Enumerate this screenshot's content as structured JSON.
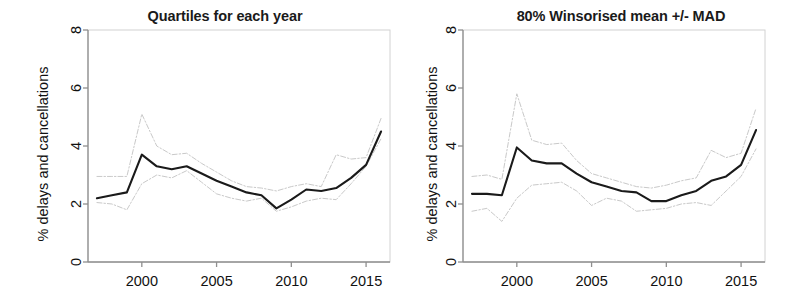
{
  "figure": {
    "width": 807,
    "height": 301,
    "background": "#ffffff"
  },
  "style": {
    "median_color": "#1a1a1a",
    "band_color": "#c9c9c9",
    "axis_color": "#9a9a9a",
    "text_color": "#111111"
  },
  "panels": [
    {
      "id": "quartiles",
      "title": "Quartiles for each year",
      "ylabel": "% delays and cancellations"
    },
    {
      "id": "winsorised",
      "title": "80% Winsorised mean +/- MAD",
      "ylabel": "% delays and cancellations"
    }
  ],
  "chart_data": [
    {
      "type": "line",
      "title": "Quartiles for each year",
      "xlabel": "",
      "ylabel": "% delays and cancellations",
      "xlim": [
        1996.4,
        2016.6
      ],
      "ylim": [
        0,
        8
      ],
      "xticks": [
        2000,
        2005,
        2010,
        2015
      ],
      "yticks": [
        0,
        2,
        4,
        6,
        8
      ],
      "grid": false,
      "legend": "none",
      "x": [
        1997,
        1998,
        1999,
        2000,
        2001,
        2002,
        2003,
        2004,
        2005,
        2006,
        2007,
        2008,
        2009,
        2010,
        2011,
        2012,
        2013,
        2014,
        2015,
        2016
      ],
      "series": [
        {
          "name": "Median",
          "style": "solid",
          "color": "#1a1a1a",
          "values": [
            2.2,
            2.3,
            2.4,
            3.7,
            3.3,
            3.2,
            3.3,
            3.05,
            2.8,
            2.6,
            2.4,
            2.3,
            1.85,
            2.15,
            2.5,
            2.45,
            2.55,
            2.9,
            3.35,
            4.5
          ]
        },
        {
          "name": "Upper quartile",
          "style": "dashed",
          "color": "#c9c9c9",
          "values": [
            2.95,
            2.95,
            2.95,
            5.1,
            4.0,
            3.7,
            3.75,
            3.4,
            3.1,
            2.8,
            2.6,
            2.55,
            2.45,
            2.6,
            2.7,
            2.6,
            3.7,
            3.55,
            3.6,
            4.95
          ]
        },
        {
          "name": "Lower quartile",
          "style": "dashed",
          "color": "#c9c9c9",
          "values": [
            2.05,
            2.0,
            1.8,
            2.7,
            3.0,
            2.9,
            3.15,
            2.75,
            2.35,
            2.2,
            2.1,
            2.2,
            1.75,
            1.9,
            2.1,
            2.2,
            2.15,
            2.7,
            3.3,
            4.25
          ]
        }
      ]
    },
    {
      "type": "line",
      "title": "80% Winsorised mean +/- MAD",
      "xlabel": "",
      "ylabel": "% delays and cancellations",
      "xlim": [
        1996.4,
        2016.6
      ],
      "ylim": [
        0,
        8
      ],
      "xticks": [
        2000,
        2005,
        2010,
        2015
      ],
      "yticks": [
        0,
        2,
        4,
        6,
        8
      ],
      "grid": false,
      "legend": "none",
      "x": [
        1997,
        1998,
        1999,
        2000,
        2001,
        2002,
        2003,
        2004,
        2005,
        2006,
        2007,
        2008,
        2009,
        2010,
        2011,
        2012,
        2013,
        2014,
        2015,
        2016
      ],
      "series": [
        {
          "name": "80% Winsorised mean",
          "style": "solid",
          "color": "#1a1a1a",
          "values": [
            2.35,
            2.35,
            2.3,
            3.95,
            3.5,
            3.4,
            3.4,
            3.05,
            2.75,
            2.6,
            2.45,
            2.4,
            2.1,
            2.1,
            2.3,
            2.45,
            2.8,
            2.95,
            3.35,
            4.55
          ]
        },
        {
          "name": "Mean + MAD",
          "style": "dashed",
          "color": "#c9c9c9",
          "values": [
            2.95,
            3.0,
            2.85,
            5.8,
            4.2,
            4.05,
            4.1,
            3.5,
            3.05,
            2.9,
            2.75,
            2.6,
            2.55,
            2.65,
            2.8,
            2.9,
            3.85,
            3.6,
            3.75,
            5.3
          ]
        },
        {
          "name": "Mean - MAD",
          "style": "dashed",
          "color": "#c9c9c9",
          "values": [
            1.75,
            1.85,
            1.4,
            2.2,
            2.65,
            2.7,
            2.75,
            2.45,
            1.95,
            2.2,
            2.1,
            1.75,
            1.8,
            1.85,
            2.0,
            2.05,
            1.95,
            2.45,
            2.95,
            3.9
          ]
        }
      ]
    }
  ],
  "axes": {
    "yticklabels": [
      "0",
      "2",
      "4",
      "6",
      "8"
    ],
    "xticklabels": [
      "2000",
      "2005",
      "2010",
      "2015"
    ]
  }
}
